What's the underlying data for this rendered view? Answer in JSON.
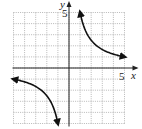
{
  "chart_data": {
    "type": "line",
    "title": "",
    "xlabel": "x",
    "ylabel": "y",
    "xlim": [
      -5,
      5
    ],
    "ylim": [
      -5,
      5
    ],
    "grid": true,
    "tick_labels": {
      "x": [
        "5"
      ],
      "y": [
        "5"
      ]
    },
    "function": "y = 5/x",
    "series": [
      {
        "name": "branch-positive",
        "x": [
          1,
          1.25,
          1.5,
          2,
          2.5,
          3,
          4,
          5
        ],
        "y": [
          5,
          4,
          3.33,
          2.5,
          2,
          1.67,
          1.25,
          1
        ]
      },
      {
        "name": "branch-negative",
        "x": [
          -5,
          -4,
          -3,
          -2.5,
          -2,
          -1.5,
          -1.25,
          -1
        ],
        "y": [
          -1,
          -1.25,
          -1.67,
          -2,
          -2.5,
          -3.33,
          -4,
          -5
        ]
      }
    ]
  },
  "labels": {
    "x_axis": "x",
    "y_axis": "y",
    "x_tick": "5",
    "y_tick": "5"
  },
  "colors": {
    "grid": "#9a9a9a",
    "axis": "#222222",
    "curve": "#111111"
  }
}
